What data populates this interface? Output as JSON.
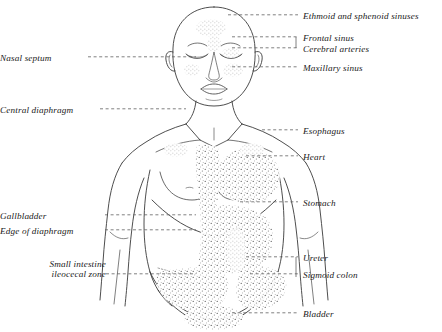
{
  "figure": {
    "background_color": "#ffffff",
    "ink_color": "#2b2b2b",
    "leader_line_style": "dashed"
  },
  "labels_left": [
    {
      "name": "nasal-septum",
      "text": "Nasal septum",
      "x": 28,
      "y": 60,
      "leader_from": 88,
      "leader_to": 196
    },
    {
      "name": "central-diaphragm",
      "text": "Central diaphragm",
      "x": 14,
      "y": 112,
      "leader_from": 100,
      "leader_to": 186
    },
    {
      "name": "gallbladder",
      "text": "Gallbladder",
      "x": 42,
      "y": 218,
      "leader_from": 105,
      "leader_to": 196
    },
    {
      "name": "edge-of-diaphragm",
      "text": "Edge of diaphragm",
      "x": 14,
      "y": 233,
      "leader_from": 105,
      "leader_to": 196
    }
  ],
  "label_left_two_line": {
    "name": "small-intestine-ileocecal-zone",
    "line1": "Small intestine",
    "line2": "ileocecal zone",
    "x": 24,
    "y": 266,
    "leader_y": 277,
    "leader_from": 106,
    "leader_to": 196
  },
  "labels_right": [
    {
      "name": "ethmoid-and-sphenoid-sinuses",
      "text": "Ethmoid and sphenoid sinuses",
      "x": 303,
      "y": 18,
      "leader_from": 228,
      "leader_to": 298
    },
    {
      "name": "frontal-sinus",
      "text": "Frontal sinus",
      "x": 303,
      "y": 40,
      "leader_from": 232,
      "leader_to": 298
    },
    {
      "name": "cerebral-arteries",
      "text": "Cerebral arteries",
      "x": 303,
      "y": 51,
      "leader_from": 232,
      "leader_to": 298
    },
    {
      "name": "maxillary-sinus",
      "text": "Maxillary sinus",
      "x": 303,
      "y": 70,
      "leader_from": 232,
      "leader_to": 298
    },
    {
      "name": "esophagus",
      "text": "Esophagus",
      "x": 303,
      "y": 133,
      "leader_from": 262,
      "leader_to": 298
    },
    {
      "name": "heart",
      "text": "Heart",
      "x": 303,
      "y": 159,
      "leader_from": 246,
      "leader_to": 298
    },
    {
      "name": "stomach",
      "text": "Stomach",
      "x": 303,
      "y": 205,
      "leader_from": 240,
      "leader_to": 298
    },
    {
      "name": "ureter",
      "text": "Ureter",
      "x": 303,
      "y": 260,
      "leader_from": 246,
      "leader_to": 298
    },
    {
      "name": "sigmoid-colon",
      "text": "Sigmoid colon",
      "x": 303,
      "y": 277,
      "leader_from": 250,
      "leader_to": 298
    },
    {
      "name": "bladder",
      "text": "Bladder",
      "x": 303,
      "y": 316,
      "leader_from": 232,
      "leader_to": 298
    }
  ],
  "body_regions": [
    {
      "name": "head",
      "note": "bald head, closed eyes, stippled forehead, glabella, cheek"
    },
    {
      "name": "neck-and-shoulders",
      "note": "clavicles and trapezius outline"
    },
    {
      "name": "chest",
      "note": "stippled sternal and left pectoral zones"
    },
    {
      "name": "abdomen",
      "note": "navel, costal margin, dense stippling"
    },
    {
      "name": "pelvis",
      "note": "inguinal curve and groin outline"
    },
    {
      "name": "arms",
      "note": "both arms drawn to mid-forearm"
    }
  ]
}
